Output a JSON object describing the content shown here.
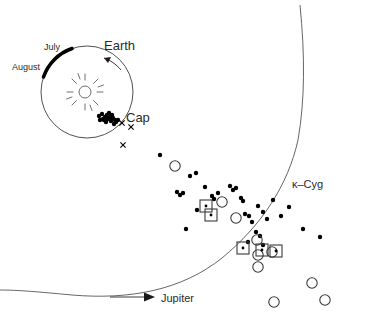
{
  "figure": {
    "background_color": "#ffffff",
    "ink_color": "#000000",
    "width": 373,
    "height": 331
  },
  "labels": {
    "earth": "Earth",
    "july": "July",
    "august": "August",
    "cap": "Cap",
    "kappa_cyg": "κ–Cyg",
    "jupiter": "Jupiter"
  },
  "inset": {
    "name": "earth-orbit-inset",
    "orbit_center": [
      87,
      92
    ],
    "orbit_radius": 46,
    "sun_center": [
      85,
      92
    ],
    "sun_radius": 6,
    "sun_ray_count": 12,
    "thick_segment_label_start": "July",
    "thick_segment_label_end": "August",
    "motion_arrow": "clockwise-arrow-on-orbit"
  },
  "chart_data": {
    "type": "scatter",
    "xlabel": "",
    "ylabel": "",
    "xlim": [
      0,
      373
    ],
    "ylim": [
      0,
      331
    ],
    "grid": false,
    "legend": "none",
    "annotations": [
      {
        "text": "Earth",
        "x": 128,
        "y": 46
      },
      {
        "text": "July",
        "x": 56,
        "y": 47
      },
      {
        "text": "August",
        "x": 32,
        "y": 67
      },
      {
        "text": "Cap",
        "x": 131,
        "y": 118
      },
      {
        "text": "κ–Cyg",
        "x": 297,
        "y": 184
      },
      {
        "text": "Jupiter",
        "x": 164,
        "y": 298
      }
    ],
    "series": [
      {
        "name": "filled-dots",
        "marker": "filled-circle",
        "color": "#000000",
        "points": [
          [
            99,
            116
          ],
          [
            102,
            114
          ],
          [
            105,
            117
          ],
          [
            104,
            120
          ],
          [
            107,
            115
          ],
          [
            108,
            119
          ],
          [
            110,
            117
          ],
          [
            111,
            121
          ],
          [
            113,
            118
          ],
          [
            115,
            120
          ],
          [
            109,
            113
          ],
          [
            112,
            115
          ],
          [
            116,
            122
          ],
          [
            118,
            120
          ],
          [
            106,
            122
          ],
          [
            103,
            119
          ],
          [
            100,
            120
          ],
          [
            114,
            124
          ],
          [
            160,
            155
          ],
          [
            190,
            176
          ],
          [
            196,
            173
          ],
          [
            177,
            192
          ],
          [
            180,
            195
          ],
          [
            183,
            193
          ],
          [
            205,
            187
          ],
          [
            212,
            196
          ],
          [
            214,
            199
          ],
          [
            218,
            193
          ],
          [
            230,
            186
          ],
          [
            233,
            190
          ],
          [
            236,
            188
          ],
          [
            241,
            198
          ],
          [
            243,
            201
          ],
          [
            197,
            210
          ],
          [
            186,
            229
          ],
          [
            245,
            214
          ],
          [
            249,
            216
          ],
          [
            252,
            222
          ],
          [
            258,
            206
          ],
          [
            263,
            212
          ],
          [
            267,
            219
          ],
          [
            256,
            232
          ],
          [
            260,
            236
          ],
          [
            248,
            242
          ],
          [
            263,
            245
          ],
          [
            303,
            229
          ],
          [
            320,
            237
          ],
          [
            273,
            200
          ],
          [
            281,
            216
          ],
          [
            289,
            207
          ]
        ]
      },
      {
        "name": "open-circles",
        "marker": "open-circle",
        "color": "#3a3a3a",
        "points": [
          [
            175,
            166
          ],
          [
            222,
            202
          ],
          [
            236,
            218
          ],
          [
            257,
            240
          ],
          [
            258,
            255
          ],
          [
            258,
            267
          ],
          [
            272,
            252
          ],
          [
            274,
            302
          ],
          [
            325,
            300
          ],
          [
            312,
            283
          ]
        ]
      },
      {
        "name": "squares",
        "marker": "open-square",
        "color": "#3a3a3a",
        "points": [
          [
            206,
            206
          ],
          [
            211,
            215
          ],
          [
            243,
            248
          ],
          [
            262,
            250
          ],
          [
            276,
            251
          ]
        ]
      },
      {
        "name": "x-markers",
        "marker": "x",
        "color": "#000000",
        "points": [
          [
            122,
            123
          ],
          [
            131,
            127
          ],
          [
            123,
            145
          ]
        ]
      }
    ],
    "curves": [
      {
        "name": "meteor-stream-arc",
        "description": "large arc from top-right down to lower-left"
      },
      {
        "name": "earth-orbit-circle",
        "description": "inset orbit circle"
      }
    ]
  }
}
